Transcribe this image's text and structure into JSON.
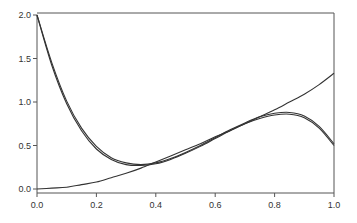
{
  "chart_data": {
    "type": "line",
    "title": "",
    "xlabel": "",
    "ylabel": "",
    "xlim": [
      0.0,
      1.0
    ],
    "ylim": [
      0.0,
      2.0
    ],
    "grid": false,
    "legend": null,
    "x_ticks": [
      "0.0",
      "0.2",
      "0.4",
      "0.6",
      "0.8",
      "1.0"
    ],
    "y_ticks": [
      "0.0",
      "0.5",
      "1.0",
      "1.5",
      "2.0"
    ],
    "x": [
      0.0,
      0.05,
      0.1,
      0.15,
      0.2,
      0.25,
      0.3,
      0.35,
      0.4,
      0.45,
      0.5,
      0.55,
      0.6,
      0.65,
      0.7,
      0.75,
      0.8,
      0.85,
      0.9,
      0.95,
      1.0
    ],
    "series": [
      {
        "name": "curve A",
        "values": [
          2.0,
          1.42,
          0.98,
          0.67,
          0.46,
          0.34,
          0.28,
          0.27,
          0.29,
          0.34,
          0.41,
          0.49,
          0.58,
          0.67,
          0.75,
          0.81,
          0.85,
          0.86,
          0.82,
          0.7,
          0.5
        ]
      },
      {
        "name": "curve B",
        "values": [
          2.0,
          1.45,
          1.01,
          0.7,
          0.49,
          0.36,
          0.3,
          0.28,
          0.3,
          0.35,
          0.42,
          0.5,
          0.59,
          0.68,
          0.76,
          0.83,
          0.87,
          0.88,
          0.84,
          0.72,
          0.52
        ]
      },
      {
        "name": "curve C",
        "values": [
          0.0,
          0.01,
          0.02,
          0.05,
          0.08,
          0.13,
          0.18,
          0.24,
          0.31,
          0.38,
          0.45,
          0.52,
          0.6,
          0.67,
          0.75,
          0.83,
          0.91,
          1.0,
          1.09,
          1.2,
          1.33
        ]
      }
    ]
  },
  "colors": {
    "line": "#333333",
    "axis": "#555555"
  }
}
